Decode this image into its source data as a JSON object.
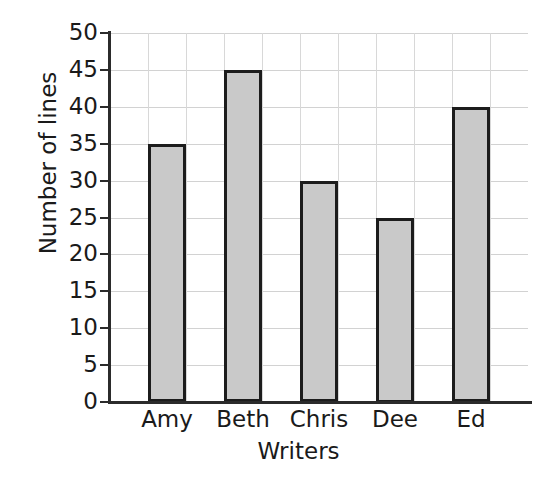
{
  "chart_data": {
    "type": "bar",
    "title": "",
    "xlabel": "Writers",
    "ylabel": "Number of lines",
    "categories": [
      "Amy",
      "Beth",
      "Chris",
      "Dee",
      "Ed"
    ],
    "values": [
      35,
      45,
      30,
      25,
      40
    ],
    "ylim": [
      0,
      50
    ],
    "ytick_step": 5,
    "ytick_labels": [
      "50",
      "45",
      "40",
      "35",
      "30",
      "25",
      "20",
      "15",
      "10",
      "5",
      "0"
    ],
    "ytick_values": [
      50,
      45,
      40,
      35,
      30,
      25,
      20,
      15,
      10,
      5,
      0
    ],
    "grid": true,
    "grid_horizontal": true,
    "grid_vertical": true,
    "legend": false,
    "legend_position": "none",
    "bar_fill_color": "#c9c9c9",
    "bar_border_color": "#1c1c1c",
    "gridline_color": "#d2d2d2",
    "axis_color": "#2b2b2b",
    "text_color": "#1a1a1a",
    "background_color": "#ffffff"
  }
}
